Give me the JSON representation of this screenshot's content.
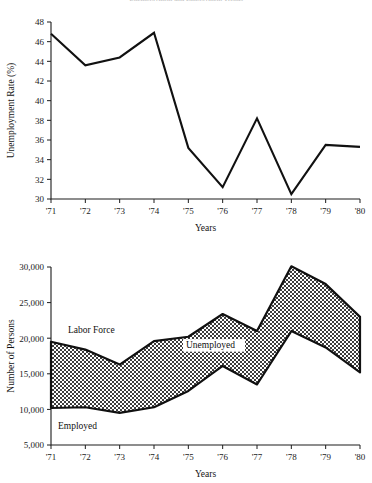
{
  "figure": {
    "title_faint": "Unemployment and Employment Trends",
    "shading_color": "#8f8f8f",
    "line_color": "#111111"
  },
  "chart_data": [
    {
      "id": "unemployment-rate",
      "type": "line",
      "title": "",
      "xlabel": "Years",
      "ylabel": "Unemployment Rate (%)",
      "categories": [
        "'71",
        "'72",
        "'73",
        "'74",
        "'75",
        "'76",
        "'77",
        "'78",
        "'79",
        "'80"
      ],
      "values": [
        46.8,
        43.6,
        44.4,
        46.9,
        35.2,
        31.2,
        38.2,
        30.5,
        35.5,
        35.3
      ],
      "ylim": [
        30,
        48
      ],
      "yticks": [
        30,
        32,
        34,
        36,
        38,
        40,
        42,
        44,
        46,
        48
      ],
      "ytick_labels": [
        "30",
        "32",
        "34",
        "36",
        "38",
        "40",
        "42",
        "44",
        "46",
        "48"
      ],
      "grid": false,
      "legend": "none"
    },
    {
      "id": "labor-force-employment",
      "type": "area",
      "title": "",
      "xlabel": "Years",
      "ylabel": "Number of Persons",
      "categories": [
        "'71",
        "'72",
        "'73",
        "'74",
        "'75",
        "'76",
        "'77",
        "'78",
        "'79",
        "'80"
      ],
      "series": [
        {
          "name": "Labor Force",
          "values": [
            19500,
            18400,
            16300,
            19600,
            20200,
            23400,
            21000,
            30100,
            27600,
            23000
          ]
        },
        {
          "name": "Employed",
          "values": [
            10200,
            10300,
            9500,
            10300,
            12600,
            16100,
            13500,
            21000,
            18700,
            15200
          ]
        }
      ],
      "band_label": "Unemployed",
      "ylim": [
        5000,
        30000
      ],
      "yticks": [
        5000,
        10000,
        15000,
        20000,
        25000,
        30000
      ],
      "ytick_labels": [
        "5,000",
        "10,000",
        "15,000",
        "20,000",
        "25,000",
        "30,000"
      ],
      "grid": false,
      "legend": "inline-annotations"
    }
  ],
  "annotations": {
    "labor_force": "Labor Force",
    "unemployed": "Unemployed",
    "employed": "Employed"
  }
}
